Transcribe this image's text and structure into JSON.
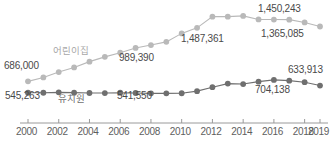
{
  "chart_data": {
    "type": "line",
    "title": "",
    "subtitle": "",
    "xlabel": "",
    "ylabel": "",
    "grid": false,
    "legend_position": "inline-annotation",
    "x": [
      2000,
      2001,
      2002,
      2003,
      2004,
      2005,
      2006,
      2007,
      2008,
      2009,
      2010,
      2011,
      2012,
      2013,
      2014,
      2015,
      2016,
      2017,
      2018,
      2019
    ],
    "xticks": [
      "2000",
      "2002",
      "2004",
      "2006",
      "2008",
      "2010",
      "2012",
      "2014",
      "2016",
      "2018",
      "2019"
    ],
    "xlim": [
      2000,
      2019
    ],
    "ylim": [
      480000,
      1520000
    ],
    "series": [
      {
        "name": "어린이집",
        "color": "#b9b9b9",
        "values": [
          686000,
          734192,
          800991,
          858345,
          930252,
          989390,
          1040361,
          1099933,
          1135502,
          1175049,
          1279910,
          1348729,
          1487361,
          1486980,
          1496671,
          1452813,
          1451215,
          1450243,
          1415742,
          1365085
        ],
        "labels": [
          {
            "x": 2000,
            "text": "686,000"
          },
          {
            "x": 2005,
            "text": "989,390"
          },
          {
            "x": 2012,
            "text": "1,487,361"
          },
          {
            "x": 2017,
            "text": "1,450,243"
          },
          {
            "x": 2019,
            "text": "1,365,085"
          }
        ]
      },
      {
        "name": "유치원",
        "color": "#6f6f6f",
        "values": [
          545263,
          545142,
          550256,
          546531,
          541713,
          541550,
          545812,
          541603,
          537822,
          537361,
          538587,
          564834,
          613749,
          658188,
          652546,
          682553,
          704138,
          694631,
          675998,
          633913
        ],
        "labels": [
          {
            "x": 2000,
            "text": "545,263"
          },
          {
            "x": 2005,
            "text": "541,550"
          },
          {
            "x": 2016,
            "text": "704,138"
          },
          {
            "x": 2019,
            "text": "633,913"
          }
        ]
      }
    ],
    "annotations": [
      {
        "name": "series-label-daycare",
        "text": "어린이집",
        "style": "light"
      },
      {
        "name": "series-label-kindergarten",
        "text": "유치원",
        "style": "dark"
      }
    ]
  },
  "labels": {
    "daycare_name": "어린이집",
    "kindergarten_name": "유치원",
    "daycare_2000": "686,000",
    "daycare_2005": "989,390",
    "daycare_2012": "1,487,361",
    "daycare_2017": "1,450,243",
    "daycare_2019": "1,365,085",
    "kinder_2000": "545,263",
    "kinder_2005": "541,550",
    "kinder_2016": "704,138",
    "kinder_2019": "633,913"
  },
  "axis": {
    "ticks": [
      "2000",
      "2002",
      "2004",
      "2006",
      "2008",
      "2010",
      "2012",
      "2014",
      "2016",
      "2018",
      "2019"
    ]
  }
}
